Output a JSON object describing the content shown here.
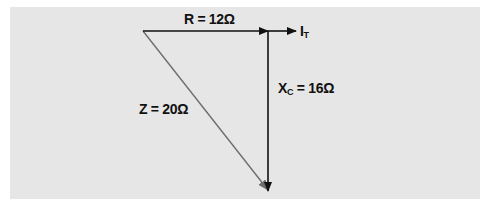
{
  "diagram": {
    "type": "impedance-phasor-triangle",
    "labels": {
      "resistance": "R = 12Ω",
      "reactance_main": "X",
      "reactance_sub": "C",
      "reactance_value": " = 16Ω",
      "impedance": "Z = 20Ω",
      "current_main": "I",
      "current_sub": "T"
    },
    "values": {
      "R_ohms": 12,
      "Xc_ohms": 16,
      "Z_ohms": 20
    },
    "colors": {
      "background": "#e6e6e6",
      "vector_dark": "#111111",
      "hypotenuse": "#6e6e6e"
    }
  }
}
